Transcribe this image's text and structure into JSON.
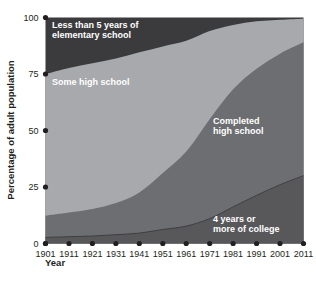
{
  "chart_data": {
    "type": "area",
    "title": "",
    "subtitle": "",
    "xlabel": "Year",
    "ylabel": "Percentage of adult population",
    "stacked": true,
    "grid": false,
    "legend_position": "inline-annotations",
    "xlim": [
      1901,
      2011
    ],
    "ylim": [
      0,
      100
    ],
    "x": [
      1901,
      1911,
      1921,
      1931,
      1941,
      1951,
      1961,
      1971,
      1981,
      1991,
      2001,
      2011
    ],
    "xtick_labels": [
      "1901",
      "1911",
      "1921",
      "1931",
      "1941",
      "1951",
      "1961",
      "1971",
      "1981",
      "1991",
      "2001",
      "2011"
    ],
    "ytick_labels": [
      "0",
      "25",
      "50",
      "75",
      "100"
    ],
    "yticks": [
      0,
      25,
      50,
      75,
      100
    ],
    "series": [
      {
        "name": "4 years or more of college",
        "label": "4 years or\nmore of college",
        "label_line_1": "4 years or",
        "label_line_2": "more of college",
        "color": "#58585b",
        "values": [
          2.7,
          3.0,
          3.3,
          3.9,
          4.6,
          6.2,
          7.7,
          11.0,
          16.2,
          21.3,
          26.0,
          30.0
        ]
      },
      {
        "name": "Completed high school",
        "label": "Completed\nhigh school",
        "label_line_1": "Completed",
        "label_line_2": "high school",
        "color": "#6d6e71",
        "values": [
          9.6,
          10.7,
          12.0,
          14.0,
          18.0,
          25.0,
          33.0,
          44.0,
          52.0,
          56.0,
          58.0,
          59.0
        ]
      },
      {
        "name": "Some high school",
        "label": "Some high school",
        "label_line_1": "Some high school",
        "label_line_2": "",
        "color": "#a7a9ac",
        "values": [
          62.7,
          64.0,
          64.5,
          64.0,
          62.0,
          56.0,
          49.0,
          39.0,
          28.5,
          21.0,
          15.0,
          10.5
        ]
      },
      {
        "name": "Less than 5 years of elementary school",
        "label": "Less than 5 years of\nelementary school",
        "label_line_1": "Less than 5 years of",
        "label_line_2": "elementary school",
        "color": "#3b3b3d",
        "values": [
          25.0,
          22.3,
          20.2,
          18.1,
          15.4,
          12.8,
          10.3,
          6.0,
          3.3,
          1.7,
          1.0,
          0.5
        ]
      }
    ],
    "cumulative_top_boundaries": {
      "college": [
        2.7,
        3.0,
        3.3,
        3.9,
        4.6,
        6.2,
        7.7,
        11.0,
        16.2,
        21.3,
        26.0,
        30.0
      ],
      "completed_high_school": [
        12.3,
        13.7,
        15.3,
        17.9,
        22.6,
        31.2,
        40.7,
        55.0,
        68.2,
        77.3,
        84.0,
        89.0
      ],
      "some_high_school": [
        75.0,
        77.7,
        79.8,
        81.9,
        84.6,
        87.2,
        89.7,
        94.0,
        96.7,
        98.3,
        99.0,
        99.5
      ],
      "less_than_5_years": [
        100,
        100,
        100,
        100,
        100,
        100,
        100,
        100,
        100,
        100,
        100,
        100
      ]
    }
  },
  "axis": {
    "y_title": "Percentage of adult population",
    "x_title": "Year"
  },
  "colors": {
    "background": "#ffffff",
    "text": "#231f20",
    "label_text": "#ffffff",
    "band_top": "#3b3b3d",
    "band_some_hs": "#a7a9ac",
    "band_completed_hs": "#6d6e71",
    "band_college": "#58585b",
    "tick_dot": "#231f20"
  }
}
